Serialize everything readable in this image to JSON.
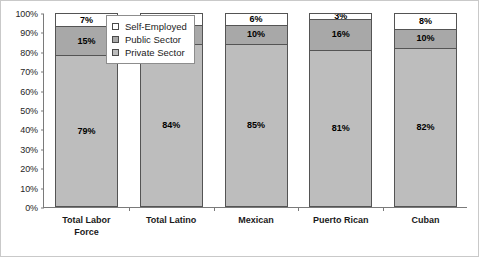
{
  "chart_data": {
    "type": "bar",
    "variant": "stacked-100-percent",
    "title": "",
    "subtitle": "",
    "xlabel": "",
    "ylabel": "",
    "ylim": [
      0,
      100
    ],
    "ytick_labels": [
      "0%",
      "10%",
      "20%",
      "30%",
      "40%",
      "50%",
      "60%",
      "70%",
      "80%",
      "90%",
      "100%"
    ],
    "ytick_values": [
      0,
      10,
      20,
      30,
      40,
      50,
      60,
      70,
      80,
      90,
      100
    ],
    "grid": false,
    "legend_position": "upper-left-inside",
    "categories": [
      "Total Labor\nForce",
      "Total Latino",
      "Mexican",
      "Puerto Rican",
      "Cuban"
    ],
    "series": [
      {
        "name": "Self-Employed",
        "color": "#ffffff",
        "values": [
          7,
          6,
          6,
          3,
          8
        ],
        "labels": [
          "7%",
          "6%",
          "6%",
          "3%",
          "8%"
        ]
      },
      {
        "name": "Public Sector",
        "color": "#a8a8a8",
        "values": [
          15,
          10,
          10,
          16,
          10
        ],
        "labels": [
          "15%",
          "10%",
          "10%",
          "16%",
          "10%"
        ]
      },
      {
        "name": "Private Sector",
        "color": "#bdbdbd",
        "values": [
          79,
          84,
          85,
          81,
          82
        ],
        "labels": [
          "79%",
          "84%",
          "85%",
          "81%",
          "82%"
        ]
      }
    ]
  },
  "legend": {
    "entries": [
      {
        "label": "Self-Employed",
        "color": "#ffffff"
      },
      {
        "label": "Public Sector",
        "color": "#a8a8a8"
      },
      {
        "label": "Private Sector",
        "color": "#bdbdbd"
      }
    ]
  },
  "colors": {
    "self_employed": "#ffffff",
    "public_sector": "#a8a8a8",
    "private_sector": "#bdbdbd",
    "axis": "#7a7a7a",
    "bar_outline": "#545454",
    "frame": "#c9c9c9"
  }
}
